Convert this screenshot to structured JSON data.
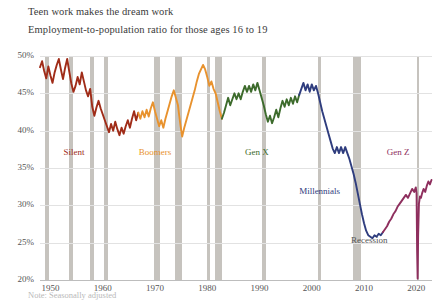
{
  "chart_data": {
    "type": "line",
    "title": "Teen work makes the dream work",
    "subtitle": "Employment-to-population ratio for those ages 16 to 19",
    "note": "Note: Seasonally adjusted",
    "xlabel": "",
    "ylabel": "",
    "xlim": [
      1948,
      2023
    ],
    "ylim": [
      20,
      50
    ],
    "ytick_labels": [
      "50%",
      "45%",
      "40%",
      "35%",
      "30%",
      "25%",
      "20%"
    ],
    "ytick_values": [
      50,
      45,
      40,
      35,
      30,
      25,
      20
    ],
    "xtick_labels": [
      "1950",
      "1960",
      "1970",
      "1980",
      "1990",
      "2000",
      "2010",
      "2020"
    ],
    "xtick_values": [
      1950,
      1960,
      1970,
      1980,
      1990,
      2000,
      2010,
      2020
    ],
    "grid": true,
    "legend": "inline-annotations",
    "colors": {
      "silent": "#a02c18",
      "boomers": "#e8922e",
      "genx": "#3d6b2c",
      "millennials": "#2f3d7e",
      "genz": "#8e2f5e",
      "recession_band": "#c3c0bb",
      "gridline": "#e2e2e2",
      "text": "#3a3a3a"
    },
    "annotations": [
      {
        "label": "Silent",
        "x": 1954.5,
        "y": 37.0,
        "color": "#a02c18"
      },
      {
        "label": "Boomers",
        "x": 1970.0,
        "y": 37.0,
        "color": "#e8922e"
      },
      {
        "label": "Gen X",
        "x": 1989.5,
        "y": 37.0,
        "color": "#3d6b2c"
      },
      {
        "label": "Millennials",
        "x": 2001.5,
        "y": 31.8,
        "color": "#2f3d7e"
      },
      {
        "label": "Gen Z",
        "x": 2016.5,
        "y": 37.0,
        "color": "#8e2f5e"
      },
      {
        "label": "Recession",
        "x": 2011.0,
        "y": 25.2,
        "color": "#555555"
      }
    ],
    "recessions": [
      {
        "start": 1948.9,
        "end": 1949.8
      },
      {
        "start": 1953.6,
        "end": 1954.4
      },
      {
        "start": 1957.6,
        "end": 1958.3
      },
      {
        "start": 1960.3,
        "end": 1961.1
      },
      {
        "start": 1969.9,
        "end": 1970.9
      },
      {
        "start": 1973.9,
        "end": 1975.2
      },
      {
        "start": 1980.0,
        "end": 1980.5
      },
      {
        "start": 1981.5,
        "end": 1982.9
      },
      {
        "start": 1990.5,
        "end": 1991.2
      },
      {
        "start": 2001.2,
        "end": 2001.8
      },
      {
        "start": 2007.9,
        "end": 2009.5
      },
      {
        "start": 2020.1,
        "end": 2020.4
      }
    ],
    "series": [
      {
        "name": "Silent",
        "color": "#a02c18",
        "points": [
          [
            1948.0,
            48.5
          ],
          [
            1948.4,
            49.3
          ],
          [
            1948.8,
            48.0
          ],
          [
            1949.2,
            47.0
          ],
          [
            1949.6,
            48.6
          ],
          [
            1950.0,
            47.4
          ],
          [
            1950.4,
            46.4
          ],
          [
            1950.8,
            47.8
          ],
          [
            1951.2,
            48.8
          ],
          [
            1951.6,
            49.6
          ],
          [
            1952.0,
            48.2
          ],
          [
            1952.4,
            46.9
          ],
          [
            1952.8,
            48.4
          ],
          [
            1953.2,
            49.6
          ],
          [
            1953.6,
            47.9
          ],
          [
            1954.0,
            46.3
          ],
          [
            1954.4,
            45.2
          ],
          [
            1954.8,
            46.0
          ],
          [
            1955.2,
            47.2
          ],
          [
            1955.6,
            46.2
          ],
          [
            1956.0,
            47.8
          ],
          [
            1956.4,
            46.6
          ],
          [
            1956.8,
            45.4
          ],
          [
            1957.2,
            44.6
          ],
          [
            1957.6,
            45.6
          ],
          [
            1958.0,
            43.2
          ],
          [
            1958.4,
            42.0
          ],
          [
            1958.8,
            43.1
          ],
          [
            1959.2,
            44.0
          ],
          [
            1959.6,
            43.0
          ],
          [
            1960.0,
            42.2
          ],
          [
            1960.4,
            41.4
          ],
          [
            1960.8,
            40.6
          ],
          [
            1961.2,
            39.8
          ],
          [
            1961.6,
            40.9
          ],
          [
            1962.0,
            40.0
          ],
          [
            1962.4,
            41.2
          ],
          [
            1962.8,
            40.2
          ],
          [
            1963.2,
            39.4
          ],
          [
            1963.6,
            40.4
          ],
          [
            1964.0,
            39.6
          ],
          [
            1964.4,
            40.6
          ],
          [
            1964.8,
            41.4
          ],
          [
            1965.2,
            40.4
          ],
          [
            1965.6,
            41.6
          ],
          [
            1966.0,
            42.6
          ],
          [
            1966.4,
            41.4
          ],
          [
            1966.8,
            42.4
          ]
        ]
      },
      {
        "name": "Boomers",
        "color": "#e8922e",
        "points": [
          [
            1966.8,
            42.4
          ],
          [
            1967.2,
            41.6
          ],
          [
            1967.6,
            42.6
          ],
          [
            1968.0,
            41.8
          ],
          [
            1968.4,
            42.8
          ],
          [
            1968.8,
            41.9
          ],
          [
            1969.2,
            43.0
          ],
          [
            1969.6,
            43.8
          ],
          [
            1970.0,
            42.6
          ],
          [
            1970.4,
            41.6
          ],
          [
            1970.8,
            40.6
          ],
          [
            1971.2,
            41.4
          ],
          [
            1971.6,
            40.4
          ],
          [
            1972.0,
            41.6
          ],
          [
            1972.4,
            42.6
          ],
          [
            1972.8,
            43.6
          ],
          [
            1973.2,
            44.6
          ],
          [
            1973.6,
            45.4
          ],
          [
            1974.0,
            44.4
          ],
          [
            1974.4,
            43.4
          ],
          [
            1974.6,
            42.2
          ],
          [
            1974.9,
            40.6
          ],
          [
            1975.2,
            39.2
          ],
          [
            1975.6,
            40.4
          ],
          [
            1976.0,
            41.4
          ],
          [
            1976.4,
            42.4
          ],
          [
            1976.8,
            43.4
          ],
          [
            1977.2,
            44.4
          ],
          [
            1977.6,
            45.4
          ],
          [
            1978.0,
            46.6
          ],
          [
            1978.4,
            47.6
          ],
          [
            1978.8,
            48.2
          ],
          [
            1979.2,
            48.8
          ],
          [
            1979.6,
            48.2
          ],
          [
            1980.0,
            47.2
          ],
          [
            1980.4,
            46.0
          ],
          [
            1980.8,
            46.6
          ],
          [
            1981.2,
            45.6
          ],
          [
            1981.6,
            45.0
          ],
          [
            1982.0,
            43.8
          ],
          [
            1982.4,
            42.6
          ],
          [
            1982.8,
            41.6
          ]
        ]
      },
      {
        "name": "Gen X",
        "color": "#3d6b2c",
        "points": [
          [
            1982.8,
            41.6
          ],
          [
            1983.2,
            42.4
          ],
          [
            1983.6,
            43.4
          ],
          [
            1984.0,
            44.4
          ],
          [
            1984.4,
            43.4
          ],
          [
            1984.8,
            44.2
          ],
          [
            1985.2,
            45.0
          ],
          [
            1985.6,
            44.2
          ],
          [
            1986.0,
            45.0
          ],
          [
            1986.4,
            44.2
          ],
          [
            1986.8,
            45.2
          ],
          [
            1987.2,
            46.0
          ],
          [
            1987.6,
            45.2
          ],
          [
            1988.0,
            46.0
          ],
          [
            1988.4,
            45.2
          ],
          [
            1988.8,
            46.2
          ],
          [
            1989.2,
            45.4
          ],
          [
            1989.6,
            46.4
          ],
          [
            1990.0,
            45.4
          ],
          [
            1990.4,
            44.4
          ],
          [
            1990.8,
            43.4
          ],
          [
            1991.2,
            42.2
          ],
          [
            1991.6,
            41.2
          ],
          [
            1992.0,
            42.0
          ],
          [
            1992.4,
            41.0
          ],
          [
            1992.8,
            41.8
          ],
          [
            1993.2,
            42.8
          ],
          [
            1993.6,
            41.8
          ],
          [
            1994.0,
            43.0
          ],
          [
            1994.4,
            44.0
          ],
          [
            1994.8,
            43.2
          ],
          [
            1995.2,
            44.2
          ],
          [
            1995.6,
            43.4
          ],
          [
            1996.0,
            44.4
          ],
          [
            1996.4,
            43.6
          ],
          [
            1996.8,
            44.6
          ],
          [
            1997.2,
            43.8
          ],
          [
            1997.6,
            44.8
          ]
        ]
      },
      {
        "name": "Millennials",
        "color": "#2f3d7e",
        "points": [
          [
            1997.6,
            44.8
          ],
          [
            1998.0,
            45.6
          ],
          [
            1998.4,
            46.4
          ],
          [
            1998.8,
            45.4
          ],
          [
            1999.2,
            46.2
          ],
          [
            1999.6,
            45.2
          ],
          [
            2000.0,
            46.2
          ],
          [
            2000.4,
            45.4
          ],
          [
            2000.8,
            46.0
          ],
          [
            2001.2,
            45.0
          ],
          [
            2001.6,
            43.8
          ],
          [
            2002.0,
            42.6
          ],
          [
            2002.4,
            41.6
          ],
          [
            2002.8,
            40.6
          ],
          [
            2003.2,
            39.6
          ],
          [
            2003.6,
            38.6
          ],
          [
            2004.0,
            37.6
          ],
          [
            2004.4,
            37.0
          ],
          [
            2004.8,
            37.8
          ],
          [
            2005.2,
            37.0
          ],
          [
            2005.6,
            37.8
          ],
          [
            2006.0,
            37.0
          ],
          [
            2006.4,
            37.8
          ],
          [
            2006.8,
            37.0
          ],
          [
            2007.2,
            36.2
          ],
          [
            2007.6,
            35.2
          ],
          [
            2008.0,
            34.2
          ],
          [
            2008.4,
            33.0
          ],
          [
            2008.8,
            31.6
          ],
          [
            2009.2,
            30.2
          ],
          [
            2009.6,
            28.8
          ],
          [
            2010.0,
            27.6
          ],
          [
            2010.4,
            26.6
          ],
          [
            2010.8,
            26.0
          ],
          [
            2011.2,
            25.8
          ],
          [
            2011.6,
            25.6
          ],
          [
            2012.0,
            26.0
          ],
          [
            2012.4,
            25.8
          ],
          [
            2012.8,
            26.2
          ],
          [
            2013.2,
            26.0
          ],
          [
            2013.6,
            26.4
          ]
        ]
      },
      {
        "name": "Gen Z",
        "color": "#8e2f5e",
        "points": [
          [
            2013.6,
            26.4
          ],
          [
            2014.0,
            26.8
          ],
          [
            2014.4,
            27.2
          ],
          [
            2014.8,
            27.8
          ],
          [
            2015.2,
            28.2
          ],
          [
            2015.6,
            28.8
          ],
          [
            2016.0,
            29.2
          ],
          [
            2016.4,
            29.8
          ],
          [
            2016.8,
            30.2
          ],
          [
            2017.2,
            30.6
          ],
          [
            2017.6,
            31.0
          ],
          [
            2018.0,
            31.4
          ],
          [
            2018.4,
            31.0
          ],
          [
            2018.8,
            31.6
          ],
          [
            2019.2,
            32.2
          ],
          [
            2019.6,
            31.8
          ],
          [
            2019.9,
            32.4
          ],
          [
            2020.05,
            31.6
          ],
          [
            2020.15,
            24.0
          ],
          [
            2020.25,
            20.2
          ],
          [
            2020.35,
            26.0
          ],
          [
            2020.5,
            30.2
          ],
          [
            2020.7,
            31.2
          ],
          [
            2020.9,
            31.0
          ],
          [
            2021.1,
            31.6
          ],
          [
            2021.4,
            32.2
          ],
          [
            2021.7,
            31.8
          ],
          [
            2022.0,
            32.6
          ],
          [
            2022.3,
            33.2
          ],
          [
            2022.6,
            32.8
          ],
          [
            2022.9,
            33.4
          ]
        ]
      }
    ]
  }
}
